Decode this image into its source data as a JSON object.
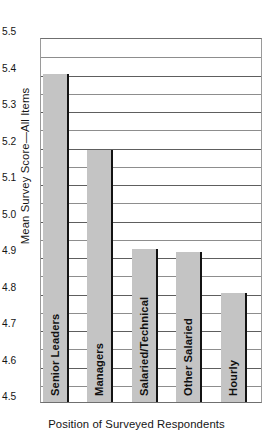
{
  "chart_data": {
    "type": "bar",
    "title": "",
    "xlabel": "Position of Surveyed Respondents",
    "ylabel": "Mean Survey Score—All Items",
    "categories": [
      "Senior Leaders",
      "Managers",
      "Salaried/Technical",
      "Other Salaried",
      "Hourly"
    ],
    "values": [
      5.4,
      5.19,
      4.92,
      4.91,
      4.8
    ],
    "ylim": [
      4.5,
      5.5
    ],
    "y_major_ticks": [
      "4.5",
      "4.6",
      "4.7",
      "4.8",
      "4.9",
      "5.0",
      "5.1",
      "5.2",
      "5.3",
      "5.4",
      "5.5"
    ],
    "y_major_values": [
      4.5,
      4.6,
      4.7,
      4.8,
      4.9,
      5.0,
      5.1,
      5.2,
      5.3,
      5.4,
      5.5
    ],
    "y_minor_values": [
      4.55,
      4.65,
      4.75,
      4.85,
      4.95,
      5.05,
      5.15,
      5.25,
      5.35,
      5.45
    ],
    "grid": true,
    "legend": "none",
    "bar_color": "#c4c4c4",
    "bar_edge_color": "#131313",
    "grid_color": "#5e5e5e",
    "axis_color": "#6f6f6f"
  }
}
